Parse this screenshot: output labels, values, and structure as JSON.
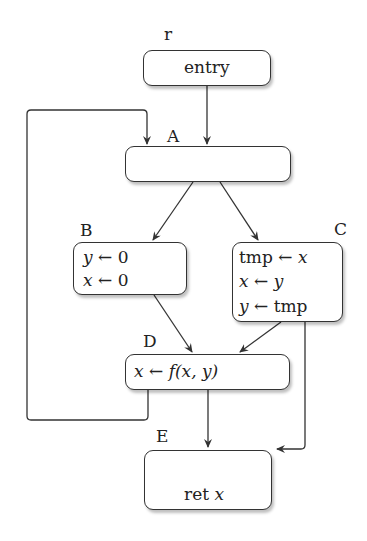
{
  "diagram": {
    "type": "control-flow-graph",
    "nodes": [
      {
        "id": "r",
        "label": "r",
        "lines": [
          "entry"
        ]
      },
      {
        "id": "A",
        "label": "A",
        "lines": []
      },
      {
        "id": "B",
        "label": "B",
        "lines": [
          "y ← 0",
          "x ← 0"
        ]
      },
      {
        "id": "C",
        "label": "C",
        "lines": [
          "tmp ← x",
          "x ← y",
          "y ← tmp"
        ]
      },
      {
        "id": "D",
        "label": "D",
        "lines": [
          "x ← f(x, y)"
        ]
      },
      {
        "id": "E",
        "label": "E",
        "lines": [
          "ret x"
        ]
      }
    ],
    "edges": [
      {
        "from": "r",
        "to": "A"
      },
      {
        "from": "A",
        "to": "B"
      },
      {
        "from": "A",
        "to": "C"
      },
      {
        "from": "B",
        "to": "D"
      },
      {
        "from": "C",
        "to": "D"
      },
      {
        "from": "C",
        "to": "E"
      },
      {
        "from": "D",
        "to": "E"
      },
      {
        "from": "D",
        "to": "A",
        "kind": "back-edge"
      }
    ]
  },
  "labels": {
    "r": "r",
    "A": "A",
    "B": "B",
    "C": "C",
    "D": "D",
    "E": "E"
  },
  "text": {
    "entry": "entry",
    "b1_lhs": "y",
    "b1_rhs": "0",
    "b2_lhs": "x",
    "b2_rhs": "0",
    "c1_lhs": "tmp",
    "c1_rhs": "x",
    "c2_lhs": "x",
    "c2_rhs": "y",
    "c3_lhs": "y",
    "c3_rhs": "tmp",
    "d1_lhs": "x",
    "d1_f": "f",
    "d1_args": "(x, y)",
    "e1_kw": "ret",
    "e1_var": "x",
    "arrow": "←"
  },
  "colors": {
    "stroke": "#333333",
    "background": "#ffffff"
  }
}
